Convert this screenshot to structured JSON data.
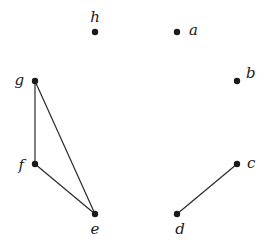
{
  "graph": {
    "nodes": [
      {
        "id": "a",
        "label": "a"
      },
      {
        "id": "b",
        "label": "b"
      },
      {
        "id": "c",
        "label": "c"
      },
      {
        "id": "d",
        "label": "d"
      },
      {
        "id": "e",
        "label": "e"
      },
      {
        "id": "f",
        "label": "f"
      },
      {
        "id": "g",
        "label": "g"
      },
      {
        "id": "h",
        "label": "h"
      }
    ],
    "edges": [
      {
        "from": "g",
        "to": "f"
      },
      {
        "from": "g",
        "to": "e"
      },
      {
        "from": "f",
        "to": "e"
      },
      {
        "from": "c",
        "to": "d"
      }
    ]
  }
}
